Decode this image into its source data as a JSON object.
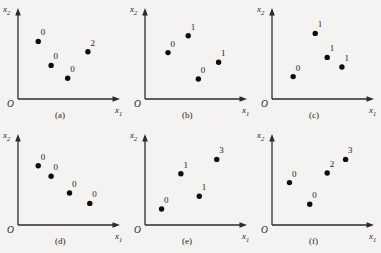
{
  "figure": {
    "background_color": "#f4f3f1",
    "ink_color": "#1c1c1c",
    "point_color": "#0d0d0d",
    "origin_label": "O",
    "x_axis_label": "x1",
    "y_axis_label": "x2"
  },
  "chart_data": {
    "type": "scatter",
    "title": "",
    "xlabel": "x₁",
    "ylabel": "x₂",
    "xlim": [
      0,
      10
    ],
    "ylim": [
      0,
      10
    ],
    "grid": false,
    "legend": "none",
    "panels": [
      {
        "caption": "(a)",
        "x": [
          2.2,
          3.6,
          5.4,
          7.6
        ],
        "y": [
          7.2,
          4.2,
          2.6,
          5.9
        ],
        "labels": [
          "0",
          "0",
          "0",
          "2"
        ],
        "label_positions": [
          "above",
          "above",
          "above",
          "above"
        ]
      },
      {
        "caption": "(b)",
        "x": [
          2.5,
          4.7,
          5.8,
          8.0
        ],
        "y": [
          5.8,
          7.9,
          2.5,
          4.6
        ],
        "labels": [
          "0",
          "1",
          "0",
          "1"
        ],
        "label_positions": [
          "above",
          "above",
          "above",
          "above"
        ]
      },
      {
        "caption": "(c)",
        "x": [
          2.3,
          4.7,
          6.0,
          7.6
        ],
        "y": [
          2.8,
          8.2,
          5.2,
          4.0
        ],
        "labels": [
          "0",
          "1",
          "1",
          "1"
        ],
        "label_positions": [
          "above",
          "above",
          "above",
          "above"
        ]
      },
      {
        "caption": "(d)",
        "x": [
          2.2,
          3.6,
          5.6,
          7.8
        ],
        "y": [
          7.4,
          6.1,
          4.0,
          2.7
        ],
        "labels": [
          "0",
          "0",
          "0",
          "0"
        ],
        "label_positions": [
          "above",
          "above",
          "above",
          "above"
        ]
      },
      {
        "caption": "(e)",
        "x": [
          1.8,
          3.9,
          5.9,
          7.8
        ],
        "y": [
          2.0,
          6.4,
          3.6,
          8.2
        ],
        "labels": [
          "0",
          "1",
          "1",
          "3"
        ],
        "label_positions": [
          "above",
          "above",
          "above",
          "above"
        ]
      },
      {
        "caption": "(f)",
        "x": [
          1.9,
          4.1,
          6.0,
          8.0
        ],
        "y": [
          5.3,
          2.6,
          6.5,
          8.2
        ],
        "labels": [
          "0",
          "0",
          "2",
          "3"
        ],
        "label_positions": [
          "above",
          "above",
          "above",
          "above"
        ]
      }
    ]
  }
}
